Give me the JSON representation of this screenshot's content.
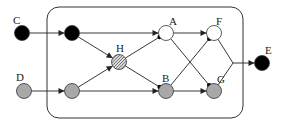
{
  "diagram": {
    "type": "directed-graph",
    "box": {
      "x": 47,
      "y": 7,
      "width": 196,
      "height": 111,
      "radius": 12,
      "stroke": "#333333"
    },
    "colors": {
      "black": "#000000",
      "gray": "#a8a8a8",
      "white": "#ffffff",
      "hatch": "#555555",
      "edge": "#222222"
    },
    "nodes": [
      {
        "id": "C",
        "label": "C",
        "x": 22,
        "y": 33,
        "fill": "black",
        "label_dx": -9,
        "label_dy": -9
      },
      {
        "id": "c2",
        "label": "",
        "x": 72,
        "y": 33,
        "fill": "black"
      },
      {
        "id": "D",
        "label": "D",
        "x": 24,
        "y": 91,
        "fill": "gray",
        "label_dx": -8,
        "label_dy": -10
      },
      {
        "id": "d2",
        "label": "",
        "x": 72,
        "y": 91,
        "fill": "gray"
      },
      {
        "id": "H",
        "label": "H",
        "x": 119,
        "y": 62,
        "fill": "hatch",
        "label_dx": -3,
        "label_dy": -10
      },
      {
        "id": "A",
        "label": "A",
        "x": 166,
        "y": 33,
        "fill": "white",
        "label_dx": 3,
        "label_dy": -8
      },
      {
        "id": "B",
        "label": "B",
        "x": 166,
        "y": 91,
        "fill": "gray",
        "label_dx": -4,
        "label_dy": -9
      },
      {
        "id": "F",
        "label": "F",
        "x": 214,
        "y": 33,
        "fill": "white",
        "label_dx": 2,
        "label_dy": -8
      },
      {
        "id": "G",
        "label": "G",
        "x": 214,
        "y": 91,
        "fill": "gray",
        "label_dx": 3,
        "label_dy": -8
      },
      {
        "id": "E",
        "label": "E",
        "x": 262,
        "y": 63,
        "fill": "black",
        "label_dx": 3,
        "label_dy": -9
      }
    ],
    "node_radius": 7.5,
    "edges": [
      {
        "from": "C",
        "to": "c2",
        "head": "arrow"
      },
      {
        "from": "D",
        "to": "d2",
        "head": "arrow"
      },
      {
        "from": "c2",
        "to": "H",
        "head": "arrow"
      },
      {
        "from": "d2",
        "to": "H",
        "head": "arrow"
      },
      {
        "from": "c2",
        "to": "A",
        "head": "arrow"
      },
      {
        "from": "d2",
        "to": "B",
        "head": "arrow"
      },
      {
        "from": "H",
        "to": "A",
        "head": "dot"
      },
      {
        "from": "H",
        "to": "B",
        "head": "dot"
      },
      {
        "from": "A",
        "to": "F",
        "head": "arrow"
      },
      {
        "from": "B",
        "to": "G",
        "head": "arrow"
      },
      {
        "from": "A",
        "to": "G",
        "head": "dot"
      },
      {
        "from": "B",
        "to": "F",
        "head": "dot"
      }
    ],
    "merge": {
      "from": [
        "F",
        "G"
      ],
      "junction": {
        "x": 233,
        "y": 63
      },
      "to": "E",
      "head": "arrow"
    }
  }
}
